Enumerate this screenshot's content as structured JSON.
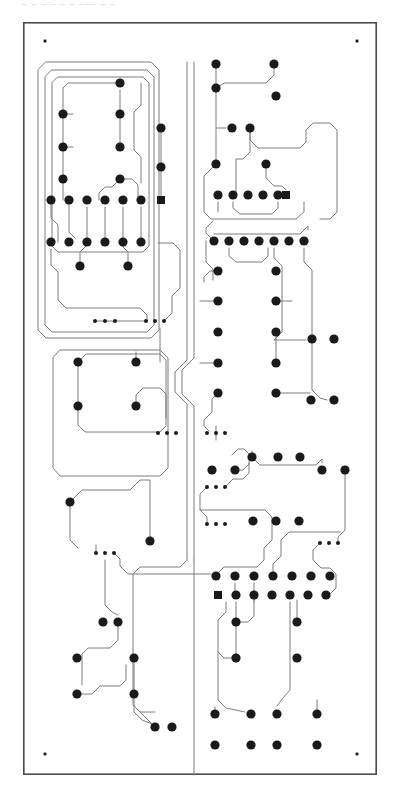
{
  "document": {
    "type": "pcb-layout-drawing",
    "title_clipped_top": "– – –   – –  – –––  – –",
    "width": 400,
    "height": 801,
    "background_color": "#ffffff"
  },
  "board": {
    "name": "board-outline",
    "x": 23,
    "y": 22,
    "width": 354,
    "height": 753,
    "stroke_color": "#4a4a4a",
    "stroke_width": 1.6,
    "fill_color": "#ffffff"
  },
  "style": {
    "trace_color": "#7d7d82",
    "trace_width": 1.0,
    "pad_color": "#1a1a1a",
    "pad_radius": 4.6,
    "small_pad_radius": 2.0,
    "fiducial_radius": 1.4,
    "square_pad_size": 8.0
  },
  "legend": {
    "round_pad_label": "round-through-hole-pad",
    "square_pad_label": "square-pin-1-pad",
    "small_pad_label": "small-via-pad",
    "fiducial_label": "corner-fiducial-mark",
    "trace_label": "copper-trace",
    "outline_label": "board-edge-outline"
  },
  "counts": {
    "round_pads": 152,
    "square_pads": 3,
    "small_pads": 18,
    "fiducials": 4
  },
  "fiducials": [
    {
      "name": "fiducial-top-left",
      "x": 45,
      "y": 41
    },
    {
      "name": "fiducial-top-right",
      "x": 357,
      "y": 41
    },
    {
      "name": "fiducial-bottom-left",
      "x": 45,
      "y": 754
    },
    {
      "name": "fiducial-bottom-right",
      "x": 357,
      "y": 754
    }
  ],
  "square_pads": [
    {
      "name": "square-pad-u1-pin1",
      "x": 161,
      "y": 200
    },
    {
      "name": "square-pad-u2-pin1",
      "x": 286,
      "y": 195
    },
    {
      "name": "square-pad-u3-pin1",
      "x": 218,
      "y": 595
    }
  ],
  "small_pads": [
    {
      "x": 95,
      "y": 321
    },
    {
      "x": 105,
      "y": 321
    },
    {
      "x": 115,
      "y": 321
    },
    {
      "x": 146,
      "y": 321
    },
    {
      "x": 155,
      "y": 321
    },
    {
      "x": 164,
      "y": 321
    },
    {
      "x": 158,
      "y": 433
    },
    {
      "x": 167,
      "y": 433
    },
    {
      "x": 176,
      "y": 433
    },
    {
      "x": 207,
      "y": 433
    },
    {
      "x": 216,
      "y": 433
    },
    {
      "x": 225,
      "y": 433
    },
    {
      "x": 207,
      "y": 487
    },
    {
      "x": 216,
      "y": 487
    },
    {
      "x": 225,
      "y": 487
    },
    {
      "x": 320,
      "y": 543
    },
    {
      "x": 329,
      "y": 543
    },
    {
      "x": 338,
      "y": 543
    },
    {
      "x": 207,
      "y": 524
    },
    {
      "x": 216,
      "y": 524
    },
    {
      "x": 225,
      "y": 524
    },
    {
      "x": 96,
      "y": 553
    },
    {
      "x": 105,
      "y": 553
    },
    {
      "x": 114,
      "y": 553
    }
  ],
  "round_pads": [
    {
      "x": 120,
      "y": 83
    },
    {
      "x": 63,
      "y": 114
    },
    {
      "x": 120,
      "y": 114
    },
    {
      "x": 63,
      "y": 147
    },
    {
      "x": 120,
      "y": 147
    },
    {
      "x": 63,
      "y": 179
    },
    {
      "x": 120,
      "y": 179
    },
    {
      "x": 161,
      "y": 128
    },
    {
      "x": 161,
      "y": 167
    },
    {
      "x": 51,
      "y": 200
    },
    {
      "x": 69,
      "y": 200
    },
    {
      "x": 87,
      "y": 200
    },
    {
      "x": 105,
      "y": 200
    },
    {
      "x": 123,
      "y": 200
    },
    {
      "x": 141,
      "y": 200
    },
    {
      "x": 51,
      "y": 242
    },
    {
      "x": 69,
      "y": 242
    },
    {
      "x": 87,
      "y": 242
    },
    {
      "x": 105,
      "y": 242
    },
    {
      "x": 123,
      "y": 242
    },
    {
      "x": 141,
      "y": 242
    },
    {
      "x": 80,
      "y": 266
    },
    {
      "x": 128,
      "y": 266
    },
    {
      "x": 78,
      "y": 362
    },
    {
      "x": 136,
      "y": 362
    },
    {
      "x": 78,
      "y": 406
    },
    {
      "x": 136,
      "y": 406
    },
    {
      "x": 70,
      "y": 502
    },
    {
      "x": 150,
      "y": 541
    },
    {
      "x": 103,
      "y": 622
    },
    {
      "x": 118,
      "y": 622
    },
    {
      "x": 77,
      "y": 658
    },
    {
      "x": 134,
      "y": 658
    },
    {
      "x": 77,
      "y": 694
    },
    {
      "x": 134,
      "y": 694
    },
    {
      "x": 155,
      "y": 727
    },
    {
      "x": 172,
      "y": 727
    },
    {
      "x": 216,
      "y": 64
    },
    {
      "x": 274,
      "y": 64
    },
    {
      "x": 216,
      "y": 88
    },
    {
      "x": 276,
      "y": 96
    },
    {
      "x": 232,
      "y": 128
    },
    {
      "x": 250,
      "y": 128
    },
    {
      "x": 216,
      "y": 164
    },
    {
      "x": 266,
      "y": 164
    },
    {
      "x": 218,
      "y": 195
    },
    {
      "x": 233,
      "y": 195
    },
    {
      "x": 248,
      "y": 195
    },
    {
      "x": 263,
      "y": 195
    },
    {
      "x": 278,
      "y": 195
    },
    {
      "x": 214,
      "y": 241
    },
    {
      "x": 229,
      "y": 241
    },
    {
      "x": 244,
      "y": 241
    },
    {
      "x": 259,
      "y": 241
    },
    {
      "x": 274,
      "y": 241
    },
    {
      "x": 289,
      "y": 241
    },
    {
      "x": 304,
      "y": 241
    },
    {
      "x": 218,
      "y": 271
    },
    {
      "x": 276,
      "y": 271
    },
    {
      "x": 218,
      "y": 301
    },
    {
      "x": 276,
      "y": 301
    },
    {
      "x": 218,
      "y": 332
    },
    {
      "x": 276,
      "y": 332
    },
    {
      "x": 312,
      "y": 339
    },
    {
      "x": 334,
      "y": 339
    },
    {
      "x": 218,
      "y": 363
    },
    {
      "x": 276,
      "y": 363
    },
    {
      "x": 218,
      "y": 393
    },
    {
      "x": 276,
      "y": 393
    },
    {
      "x": 311,
      "y": 400
    },
    {
      "x": 334,
      "y": 400
    },
    {
      "x": 252,
      "y": 457
    },
    {
      "x": 278,
      "y": 457
    },
    {
      "x": 300,
      "y": 457
    },
    {
      "x": 212,
      "y": 470
    },
    {
      "x": 235,
      "y": 470
    },
    {
      "x": 322,
      "y": 470
    },
    {
      "x": 345,
      "y": 470
    },
    {
      "x": 253,
      "y": 521
    },
    {
      "x": 276,
      "y": 521
    },
    {
      "x": 299,
      "y": 521
    },
    {
      "x": 216,
      "y": 576
    },
    {
      "x": 235,
      "y": 576
    },
    {
      "x": 254,
      "y": 576
    },
    {
      "x": 273,
      "y": 576
    },
    {
      "x": 292,
      "y": 576
    },
    {
      "x": 311,
      "y": 576
    },
    {
      "x": 330,
      "y": 576
    },
    {
      "x": 236,
      "y": 595
    },
    {
      "x": 254,
      "y": 595
    },
    {
      "x": 272,
      "y": 595
    },
    {
      "x": 290,
      "y": 595
    },
    {
      "x": 308,
      "y": 595
    },
    {
      "x": 326,
      "y": 595
    },
    {
      "x": 236,
      "y": 622
    },
    {
      "x": 297,
      "y": 622
    },
    {
      "x": 236,
      "y": 658
    },
    {
      "x": 297,
      "y": 658
    },
    {
      "x": 215,
      "y": 714
    },
    {
      "x": 251,
      "y": 714
    },
    {
      "x": 277,
      "y": 714
    },
    {
      "x": 317,
      "y": 714
    },
    {
      "x": 215,
      "y": 745
    },
    {
      "x": 251,
      "y": 745
    },
    {
      "x": 277,
      "y": 745
    },
    {
      "x": 317,
      "y": 745
    }
  ]
}
